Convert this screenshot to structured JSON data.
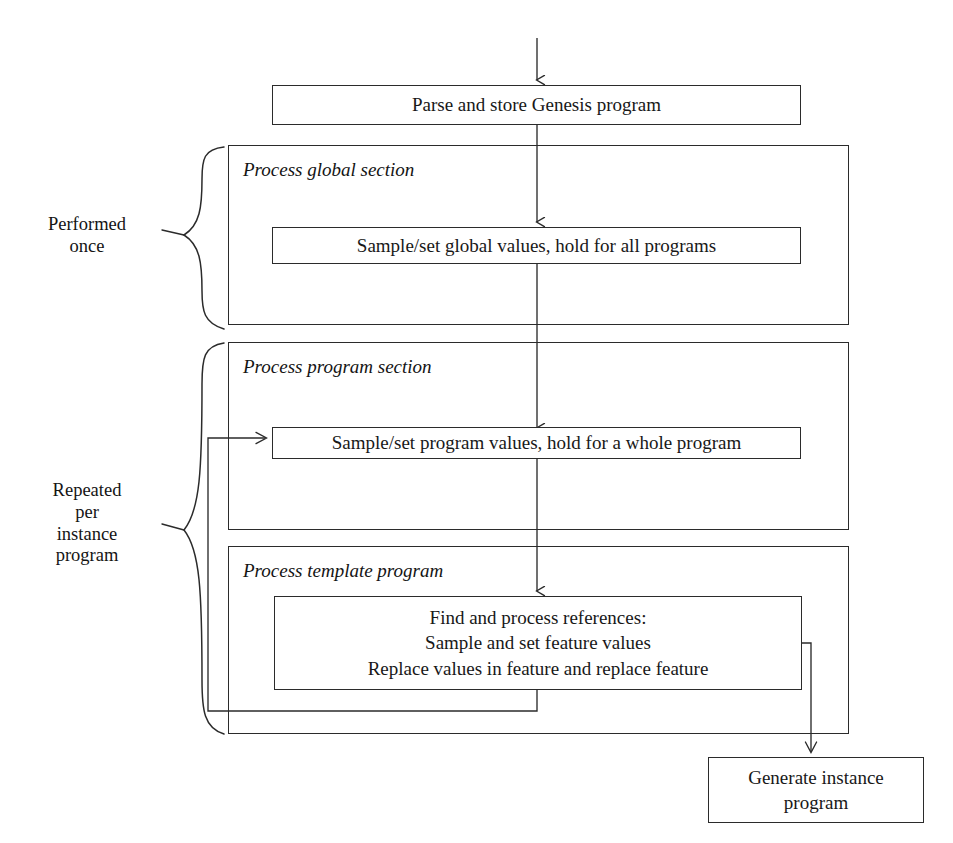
{
  "diagram": {
    "line_color": "#2b2b2b",
    "text_color": "#181818",
    "background": "#ffffff"
  },
  "nodes": {
    "parse_store": {
      "label": "Parse and store Genesis program"
    },
    "global_values": {
      "label": "Sample/set global values, hold for all programs"
    },
    "program_values": {
      "label": "Sample/set program values, hold for a whole program"
    },
    "find_process": {
      "label": "Find and process references:\nSample and set feature values\nReplace values in feature and replace feature"
    },
    "generate_instance": {
      "label": "Generate instance\nprogram"
    }
  },
  "sections": [
    {
      "key": "global",
      "title": "Process global section"
    },
    {
      "key": "program",
      "title": "Process program section"
    },
    {
      "key": "template",
      "title": "Process template program"
    }
  ],
  "braces": [
    {
      "key": "performed-once",
      "label": "Performed\nonce"
    },
    {
      "key": "repeated-per-instance",
      "label": "Repeated\nper\ninstance\nprogram"
    }
  ],
  "connectors": [
    {
      "key": "entry-arrow",
      "from": "top-of-diagram",
      "to": "parse_store",
      "kind": "arrow-down"
    },
    {
      "key": "parse-to-global",
      "from": "parse_store",
      "to": "global_values",
      "kind": "arrow-down"
    },
    {
      "key": "global-to-program",
      "from": "global_values",
      "to": "program_values",
      "kind": "arrow-down"
    },
    {
      "key": "program-to-template",
      "from": "program_values",
      "to": "find_process",
      "kind": "arrow-down"
    },
    {
      "key": "loop-back-to-program-values",
      "from": "find_process",
      "to": "program_values",
      "kind": "feedback-left"
    },
    {
      "key": "template-section-loop",
      "from": "template-section",
      "to": "program_values",
      "kind": "feedback-left"
    },
    {
      "key": "template-to-generate",
      "from": "find_process",
      "to": "generate_instance",
      "kind": "arrow-down-right"
    }
  ]
}
